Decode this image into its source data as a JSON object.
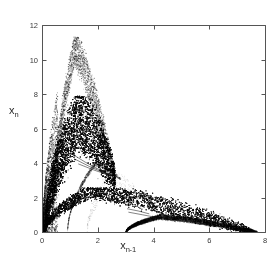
{
  "figure": {
    "background_color": "#ffffff",
    "ink_color": "#1a1a1a",
    "axis_color": "#555555",
    "width": 280,
    "height": 261
  },
  "axes": {
    "plot_left_px": 42,
    "plot_right_px": 265,
    "plot_top_px": 25,
    "plot_bottom_px": 232,
    "frame_visible": true,
    "grid": false
  },
  "labels": {
    "xlabel_base": "x",
    "xlabel_sub": "n-1",
    "ylabel_base": "x",
    "ylabel_sub": "n"
  },
  "chart_data": {
    "type": "scatter",
    "title": "",
    "xlabel": "x_n-1",
    "ylabel": "x_n",
    "xlim": [
      0,
      8
    ],
    "ylim": [
      0,
      12
    ],
    "xticks": [
      0,
      2,
      4,
      6,
      8
    ],
    "yticks": [
      0,
      2,
      4,
      6,
      8,
      10,
      12
    ],
    "xtick_labels": [
      "0",
      "2",
      "4",
      "6",
      "8"
    ],
    "ytick_labels": [
      "0",
      "2",
      "4",
      "6",
      "8",
      "10",
      "12"
    ],
    "grid": false,
    "legend": null,
    "marker": "point",
    "marker_size_px": 0.9,
    "point_color": "#111111",
    "branches": [
      {
        "name": "upper-lobe",
        "peak_x": 1.15,
        "peak_y": 10.6,
        "max_y": 11.35,
        "x_start": 0.35,
        "x_end": 2.6,
        "y_at_end": 3.1,
        "thickness": 1.05,
        "density": 0.26,
        "n_points": 5200
      },
      {
        "name": "middle-dense-band",
        "peak_x": 1.3,
        "peak_y": 6.6,
        "max_y": 7.9,
        "x_start": 0.1,
        "x_end": 2.62,
        "y_at_end": 3.2,
        "thickness": 1.75,
        "density": 1.0,
        "n_points": 16000
      },
      {
        "name": "lower-branch",
        "peak_x": 1.7,
        "peak_y": 2.35,
        "max_y": 2.6,
        "x_start": 0.05,
        "x_end": 7.5,
        "y_at_end": 0.05,
        "thickness": 0.5,
        "density": 0.8,
        "n_points": 13000
      },
      {
        "name": "filaments",
        "peak_x": 1.9,
        "peak_y": 4.0,
        "max_y": 4.6,
        "x_start": 0.9,
        "x_end": 2.8,
        "y_at_end": 3.1,
        "thickness": 0.14,
        "density": 0.5,
        "n_points": 900
      },
      {
        "name": "sparse-gap-scatter",
        "peak_x": 2.4,
        "peak_y": 3.0,
        "max_y": 3.6,
        "x_start": 1.6,
        "x_end": 3.6,
        "y_at_end": 2.0,
        "thickness": 0.6,
        "density": 0.06,
        "n_points": 260
      },
      {
        "name": "tail",
        "peak_x": 4.2,
        "peak_y": 0.9,
        "max_y": 1.25,
        "x_start": 3.0,
        "x_end": 7.7,
        "y_at_end": 0.02,
        "thickness": 0.16,
        "density": 0.7,
        "n_points": 5200
      }
    ],
    "estimated_series": {
      "x": [
        0.0,
        0.2,
        0.4,
        0.6,
        0.8,
        1.0,
        1.2,
        1.4,
        1.6,
        1.8,
        2.0,
        2.2,
        2.4,
        2.6,
        3.0,
        3.5,
        4.0,
        4.5,
        5.0,
        5.5,
        6.0,
        6.5,
        7.0,
        7.5,
        8.0
      ],
      "upper_envelope": [
        0.0,
        4.2,
        7.6,
        9.6,
        10.8,
        11.3,
        11.0,
        10.2,
        9.2,
        7.9,
        6.4,
        5.0,
        3.9,
        3.2,
        1.6,
        1.25,
        1.0,
        0.78,
        0.58,
        0.42,
        0.3,
        0.2,
        0.12,
        0.06,
        0.0
      ],
      "lower_envelope": [
        0.0,
        0.35,
        0.75,
        1.2,
        1.6,
        1.95,
        2.2,
        2.35,
        2.4,
        2.35,
        2.2,
        2.0,
        1.8,
        1.6,
        1.2,
        0.9,
        0.65,
        0.48,
        0.34,
        0.24,
        0.16,
        0.1,
        0.05,
        0.01,
        0.0
      ]
    }
  }
}
